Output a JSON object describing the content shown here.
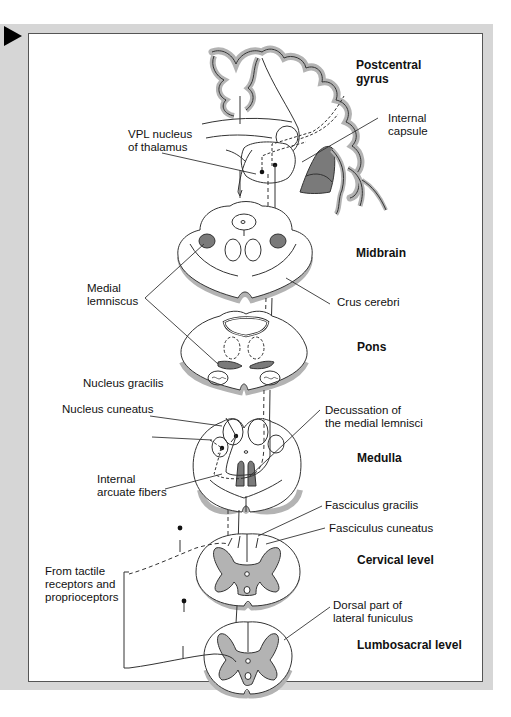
{
  "figure": {
    "type": "anatomical-pathway-diagram"
  },
  "colors": {
    "frame_gray": "#d6d6d6",
    "tissue_gray": "#b3b3b3",
    "lemniscus_dark": "#7a7a7a",
    "line": "#222222"
  },
  "levels": {
    "postcentral": "Postcentral\ngyrus",
    "midbrain": "Midbrain",
    "pons": "Pons",
    "medulla": "Medulla",
    "cervical": "Cervical level",
    "lumbosacral": "Lumbosacral level"
  },
  "labels": {
    "internal_capsule": "Internal\ncapsule",
    "vpl_nucleus": "VPL nucleus\nof thalamus",
    "medial_lemniscus": "Medial\nlemniscus",
    "crus_cerebri": "Crus cerebri",
    "nucleus_gracilis": "Nucleus gracilis",
    "nucleus_cuneatus": "Nucleus cuneatus",
    "decussation": "Decussation of\nthe medial lemnisci",
    "internal_arcuate": "Internal\narcuate fibers",
    "fasciculus_gracilis": "Fasciculus gracilis",
    "fasciculus_cuneatus": "Fasciculus cuneatus",
    "from_receptors": "From tactile\nreceptors and\nproprioceptors",
    "dorsal_lateral_funiculus": "Dorsal part of\nlateral funiculus"
  }
}
